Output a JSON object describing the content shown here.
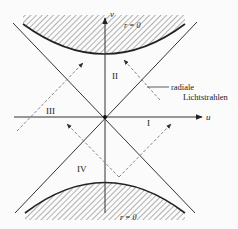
{
  "diagram": {
    "type": "Kruskal-Szekeres spacetime diagram",
    "axes": {
      "horizontal": {
        "label": "u"
      },
      "vertical": {
        "label": "v"
      }
    },
    "singularities": {
      "top_label": "r = 0",
      "bottom_label": "r = 0"
    },
    "regions": {
      "I": "I",
      "II": "II",
      "III": "III",
      "IV": "IV"
    },
    "annotation": {
      "line1": "radiale",
      "line2": "Lichtstrahlen"
    },
    "colors": {
      "background": "#fbfbfb",
      "ink": "#222222",
      "hatch": "#555555",
      "ray": "#777777"
    }
  }
}
